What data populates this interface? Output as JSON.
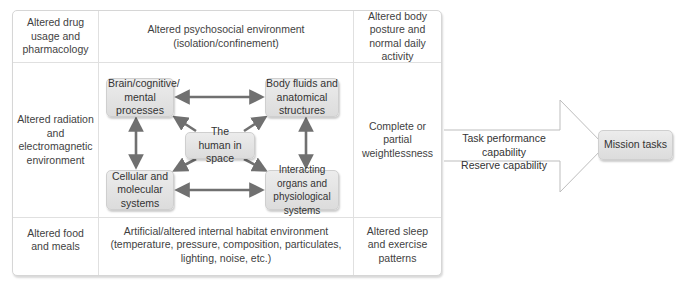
{
  "table": {
    "top_row": {
      "left": "Altered drug usage and pharmacology",
      "center_line1": "Altered psychosocial environment",
      "center_line2": "(isolation/confinement)",
      "right": "Altered body posture and normal daily activity"
    },
    "middle_row": {
      "left": "Altered radiation and electromagnetic environment",
      "right": "Complete or partial weightlessness"
    },
    "bottom_row": {
      "left": "Altered food and meals",
      "center_line1": "Artificial/altered internal habitat environment",
      "center_line2": "(temperature, pressure, composition, particulates,",
      "center_line3": "lighting, noise, etc.)",
      "right": "Altered sleep and exercise patterns"
    }
  },
  "nodes": {
    "brain": "Brain/cognitive/ mental processes",
    "body_fluids": "Body fluids and anatomical structures",
    "human": "The human in space",
    "cellular": "Cellular and molecular systems",
    "interacting": "Interacting organs and physiological systems"
  },
  "flow": {
    "line1": "Task performance capability",
    "line2": "Reserve capability",
    "target": "Mission tasks"
  },
  "colors": {
    "node_fill": "#e3e3e3",
    "arrow": "#707070",
    "border": "#d6d6d6"
  }
}
